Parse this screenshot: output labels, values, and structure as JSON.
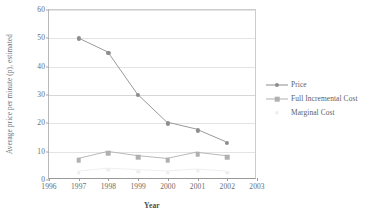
{
  "chart_data": {
    "type": "line",
    "title": "",
    "xlabel": "Year",
    "ylabel": "Average price per minute (p), estimated",
    "x": [
      1997,
      1998,
      1999,
      2000,
      2001,
      2002
    ],
    "xlim": [
      1996,
      2003
    ],
    "ylim": [
      0,
      60
    ],
    "xticks": [
      "1996",
      "1997",
      "1998",
      "1999",
      "2000",
      "2001",
      "2002",
      "2003"
    ],
    "yticks": [
      "0",
      "10",
      "20",
      "30",
      "40",
      "50",
      "60"
    ],
    "grid": "horizontal",
    "legend_position": "right",
    "series": [
      {
        "name": "Price",
        "marker": "diamond",
        "color": "#8d8d8d",
        "values": [
          50,
          45,
          30,
          20,
          17.5,
          13
        ]
      },
      {
        "name": "Full Incremental Cost",
        "marker": "square",
        "color": "#b0b0b0",
        "values": [
          7,
          9.5,
          8,
          7,
          9.2,
          8
        ]
      },
      {
        "name": "Marginal Cost",
        "marker": "triangle",
        "color": "#ededed",
        "values": [
          2.5,
          3.5,
          3,
          2.5,
          3.2,
          2.5
        ]
      }
    ]
  },
  "legend": {
    "items": [
      {
        "label": "Price"
      },
      {
        "label": "Full Incremental Cost"
      },
      {
        "label": "Marginal Cost"
      }
    ]
  },
  "colors": {
    "axis": "#999999",
    "grid": "#e4e4e4",
    "text": "#6b6b6b"
  }
}
